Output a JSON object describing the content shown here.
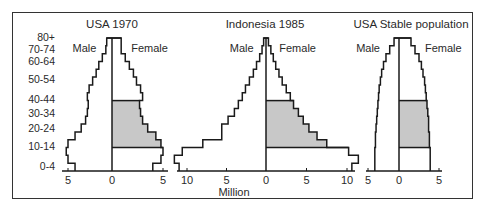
{
  "figure": {
    "unit_label": "Million",
    "age_labels": [
      "80+",
      "70-74",
      "60-64",
      "50-54",
      "40-44",
      "30-34",
      "20-24",
      "10-14",
      "0-4"
    ],
    "sex_labels": {
      "male": "Male",
      "female": "Female"
    },
    "colors": {
      "outline": "#1a1a1a",
      "shade": "#c8c8c8",
      "frame": "#333333"
    }
  },
  "chart_data": [
    {
      "type": "bar",
      "subtype": "population-pyramid",
      "title": "USA 1970",
      "xlabel": "Million",
      "age_groups": [
        "0-4",
        "5-9",
        "10-14",
        "15-19",
        "20-24",
        "25-29",
        "30-34",
        "35-39",
        "40-44",
        "45-49",
        "50-54",
        "55-59",
        "60-64",
        "65-69",
        "70-74",
        "75-79",
        "80+"
      ],
      "series": [
        {
          "name": "Male",
          "values": [
            4.2,
            5.0,
            5.2,
            5.0,
            4.2,
            3.5,
            3.0,
            2.8,
            2.7,
            2.8,
            2.6,
            2.2,
            1.8,
            1.5,
            1.1,
            0.7,
            0.6
          ]
        },
        {
          "name": "Female",
          "values": [
            4.0,
            4.8,
            5.0,
            4.8,
            4.3,
            3.5,
            3.0,
            2.8,
            2.7,
            3.0,
            2.8,
            2.4,
            2.1,
            1.7,
            1.3,
            0.9,
            0.9
          ]
        }
      ],
      "shaded_female_ages": [
        "15-19",
        "20-24",
        "25-29",
        "30-34",
        "35-39",
        "40-44"
      ],
      "xticks": {
        "male": [
          5,
          0
        ],
        "female": [
          0,
          5
        ]
      },
      "xlim": [
        -5.5,
        5.5
      ]
    },
    {
      "type": "bar",
      "subtype": "population-pyramid",
      "title": "Indonesia 1985",
      "xlabel": "Million",
      "age_groups": [
        "0-4",
        "5-9",
        "10-14",
        "15-19",
        "20-24",
        "25-29",
        "30-34",
        "35-39",
        "40-44",
        "45-49",
        "50-54",
        "55-59",
        "60-64",
        "65-69",
        "70-74",
        "75-79",
        "80+"
      ],
      "series": [
        {
          "name": "Male",
          "values": [
            11.0,
            11.6,
            10.6,
            8.0,
            5.6,
            5.6,
            4.8,
            4.0,
            3.5,
            3.0,
            2.6,
            2.1,
            1.6,
            1.2,
            0.8,
            0.5,
            0.3
          ]
        },
        {
          "name": "Female",
          "values": [
            10.6,
            11.4,
            10.2,
            7.5,
            6.3,
            5.3,
            4.6,
            4.0,
            3.4,
            3.0,
            2.5,
            2.0,
            1.6,
            1.2,
            0.9,
            0.6,
            0.3
          ]
        }
      ],
      "shaded_female_ages": [
        "15-19",
        "20-24",
        "25-29",
        "30-34",
        "35-39",
        "40-44"
      ],
      "xticks": {
        "male": [
          10,
          5,
          0
        ],
        "female": [
          0,
          5,
          10
        ]
      },
      "xlim": [
        -11,
        11
      ]
    },
    {
      "type": "bar",
      "subtype": "population-pyramid",
      "title": "USA Stable population",
      "xlabel": "Million",
      "age_groups": [
        "0-4",
        "5-9",
        "10-14",
        "15-19",
        "20-24",
        "25-29",
        "30-34",
        "35-39",
        "40-44",
        "45-49",
        "50-54",
        "55-59",
        "60-64",
        "65-69",
        "70-74",
        "75-79",
        "80+"
      ],
      "series": [
        {
          "name": "Male",
          "values": [
            3.9,
            3.9,
            3.9,
            3.8,
            3.8,
            3.7,
            3.6,
            3.5,
            3.4,
            3.3,
            3.2,
            3.0,
            2.8,
            2.5,
            2.1,
            1.5,
            0.8
          ]
        },
        {
          "name": "Female",
          "values": [
            3.9,
            3.9,
            3.9,
            3.8,
            3.8,
            3.7,
            3.7,
            3.6,
            3.5,
            3.4,
            3.3,
            3.2,
            3.0,
            2.8,
            2.5,
            2.0,
            1.5
          ]
        }
      ],
      "shaded_female_ages": [
        "15-19",
        "20-24",
        "25-29",
        "30-34",
        "35-39",
        "40-44"
      ],
      "xticks": {
        "male": [
          5,
          0
        ],
        "female": [
          0,
          5
        ]
      },
      "xlim": [
        -5,
        5
      ]
    }
  ]
}
